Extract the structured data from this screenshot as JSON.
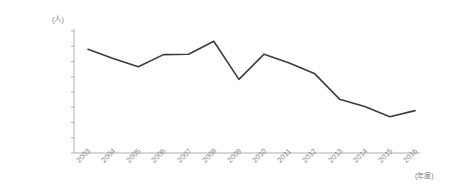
{
  "chart_data": {
    "type": "line",
    "title": "",
    "subtitle": "",
    "xlabel": "(年度)",
    "ylabel": "(人)",
    "categories": [
      "2003",
      "2004",
      "2005",
      "2006",
      "2007",
      "2008",
      "2009",
      "2010",
      "2011",
      "2012",
      "2013",
      "2014",
      "2015",
      "2016"
    ],
    "values": [
      30800000,
      30200000,
      29650000,
      30450000,
      30480000,
      31330000,
      28830000,
      30480000,
      29900000,
      29220000,
      27530000,
      27050000,
      26380000,
      26780000
    ],
    "series": [
      {
        "name": "人数",
        "values": [
          30800000,
          30200000,
          29650000,
          30450000,
          30480000,
          31330000,
          28830000,
          30480000,
          29900000,
          29220000,
          27530000,
          27050000,
          26380000,
          26780000
        ]
      }
    ],
    "ylim": [
      24000000,
      32000000
    ],
    "ytick_step": 1000000,
    "ytick_labels": [
      "32.000.000",
      "31.000.000",
      "30.000.000",
      "29.000.000",
      "28.000.000",
      "27.000.000",
      "26.000.000",
      "25.000.000",
      "24.000.000"
    ],
    "ytick_values": [
      32000000,
      31000000,
      30000000,
      29000000,
      28000000,
      27000000,
      26000000,
      25000000,
      24000000
    ],
    "grid": false,
    "legend": false,
    "legend_position": "none",
    "line_color": "#3d3d3d",
    "axis_color": "#b0b0b0",
    "tick_label_color": "#8c8c8c",
    "background_color": "#ffffff"
  }
}
